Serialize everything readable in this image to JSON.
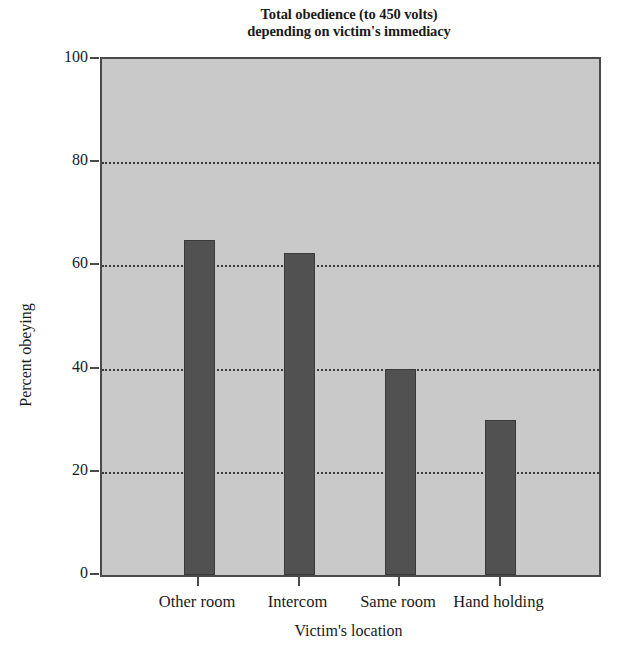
{
  "chart_data": {
    "type": "bar",
    "title": "Total obedience (to 450 volts) depending on victim's immediacy",
    "title_lines": [
      "Total obedience (to 450 volts)",
      "depending on victim's immediacy"
    ],
    "categories": [
      "Other room",
      "Intercom",
      "Same room",
      "Hand holding"
    ],
    "values": [
      65,
      62.5,
      40,
      30
    ],
    "xlabel": "Victim's location",
    "ylabel": "Percent obeying",
    "ylim": [
      0,
      100
    ],
    "yticks": [
      0,
      20,
      40,
      60,
      80,
      100
    ],
    "ytick_labels": [
      "0",
      "20",
      "40",
      "60",
      "80",
      "100"
    ],
    "grid": "horizontal-dotted",
    "legend": "none",
    "colors": {
      "bar_fill": "#515151",
      "bar_edge": "#3a3a3a",
      "plot_background": "#c9c9c9",
      "axis": "#4a4a4a",
      "gridline": "#3b3b3b",
      "text": "#1a1a1a",
      "figure_background": "#ffffff"
    }
  }
}
